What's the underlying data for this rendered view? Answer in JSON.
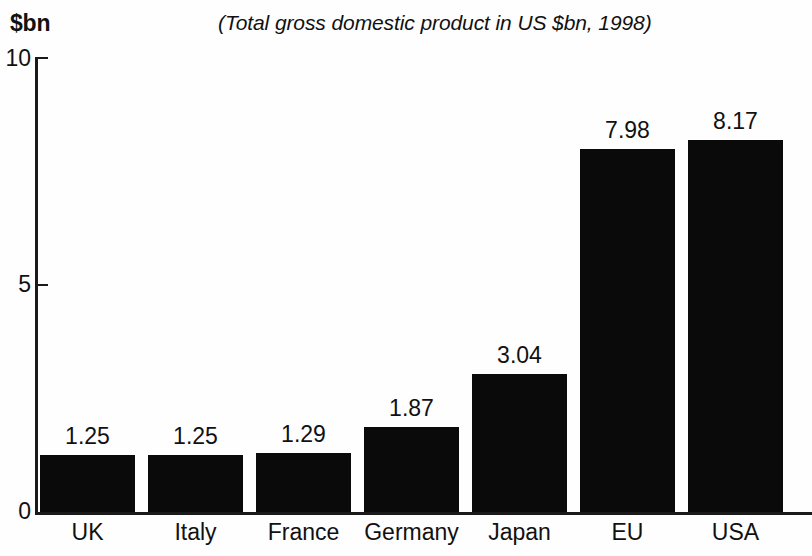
{
  "chart_data": {
    "type": "bar",
    "title": "",
    "subtitle": "(Total gross domestic product in US $bn, 1998)",
    "ylabel": "$bn",
    "xlabel": "",
    "categories": [
      "UK",
      "Italy",
      "France",
      "Germany",
      "Japan",
      "EU",
      "USA"
    ],
    "values": [
      1.25,
      1.25,
      1.29,
      1.87,
      3.04,
      7.98,
      8.17
    ],
    "value_labels": [
      "1.25",
      "1.25",
      "1.29",
      "1.87",
      "3.04",
      "7.98",
      "8.17"
    ],
    "ylim": [
      0,
      10
    ],
    "ytick_labels": [
      "0",
      "5",
      "10"
    ],
    "ytick_values": [
      0,
      5,
      10
    ],
    "grid": false,
    "legend": false,
    "bar_color": "#0a0a0a",
    "background_color": "#ffffff",
    "axis_color": "#1a1a1a"
  },
  "header": {
    "unit_label": "$bn",
    "subtitle": "(Total gross domestic product in US $bn, 1998)"
  },
  "axis": {
    "y_ticks": [
      {
        "label": "10",
        "value": 10
      },
      {
        "label": "5",
        "value": 5
      },
      {
        "label": "0",
        "value": 0
      }
    ]
  },
  "bars": [
    {
      "category": "UK",
      "value": 1.25,
      "label": "1.25"
    },
    {
      "category": "Italy",
      "value": 1.25,
      "label": "1.25"
    },
    {
      "category": "France",
      "value": 1.29,
      "label": "1.29"
    },
    {
      "category": "Germany",
      "value": 1.87,
      "label": "1.87"
    },
    {
      "category": "Japan",
      "value": 3.04,
      "label": "3.04"
    },
    {
      "category": "EU",
      "value": 7.98,
      "label": "7.98"
    },
    {
      "category": "USA",
      "value": 8.17,
      "label": "8.17"
    }
  ]
}
